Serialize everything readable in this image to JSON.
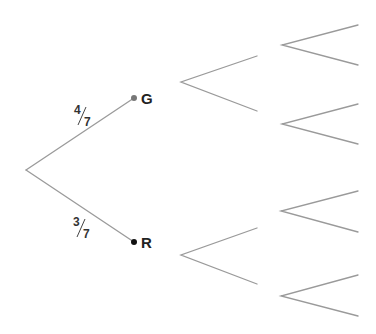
{
  "diagram": {
    "type": "probability-tree",
    "root": {
      "x": 26,
      "y": 170
    },
    "colors": {
      "branch": "#9a9a9a",
      "dot_g": "#777777",
      "dot_r": "#111111",
      "text": "#222222"
    },
    "level1": [
      {
        "label": "G",
        "end": {
          "x": 134,
          "y": 98
        },
        "probability": {
          "numerator": "4",
          "denominator": "7",
          "text": "4/7"
        }
      },
      {
        "label": "R",
        "end": {
          "x": 134,
          "y": 242
        },
        "probability": {
          "numerator": "3",
          "denominator": "7",
          "text": "3/7"
        }
      }
    ],
    "level2_empty_branches": [
      {
        "apex": {
          "x": 181,
          "y": 82
        },
        "upper": {
          "x": 257,
          "y": 56
        },
        "lower": {
          "x": 257,
          "y": 111
        }
      },
      {
        "apex": {
          "x": 181,
          "y": 255
        },
        "upper": {
          "x": 257,
          "y": 228
        },
        "lower": {
          "x": 257,
          "y": 284
        }
      }
    ],
    "level3_empty_branches": [
      {
        "apex": {
          "x": 282,
          "y": 45
        },
        "upper": {
          "x": 358,
          "y": 25
        },
        "lower": {
          "x": 358,
          "y": 65
        }
      },
      {
        "apex": {
          "x": 282,
          "y": 124
        },
        "upper": {
          "x": 358,
          "y": 104
        },
        "lower": {
          "x": 358,
          "y": 144
        }
      },
      {
        "apex": {
          "x": 281,
          "y": 211
        },
        "upper": {
          "x": 358,
          "y": 191
        },
        "lower": {
          "x": 358,
          "y": 232
        }
      },
      {
        "apex": {
          "x": 281,
          "y": 296
        },
        "upper": {
          "x": 358,
          "y": 275
        },
        "lower": {
          "x": 358,
          "y": 316
        }
      }
    ]
  }
}
